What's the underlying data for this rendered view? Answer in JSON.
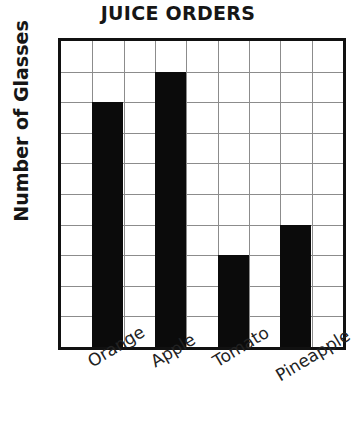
{
  "chart_data": {
    "type": "bar",
    "title": "JUICE ORDERS",
    "xlabel": "",
    "ylabel": "Number of Glasses",
    "categories": [
      "Orange",
      "Apple",
      "Tomato",
      "Pineapple"
    ],
    "values": [
      8,
      9,
      3,
      4
    ],
    "ylim": [
      0,
      10
    ],
    "y_ticks": [
      0,
      2,
      4,
      6,
      8,
      10
    ],
    "y_tick_labels": [
      "0",
      "2",
      "4",
      "6",
      "8",
      "10"
    ],
    "y_gridline_step": 1,
    "grid": true,
    "legend": false,
    "bar_color": "#0b0b0b",
    "grid_color": "#8c8c8c",
    "axis_color": "#111111",
    "x_tick_label_rotation": -31,
    "columns_total": 9,
    "bar_columns": [
      2,
      4,
      6,
      8
    ]
  },
  "axes": {
    "title": "JUICE ORDERS",
    "y_title": "Number of Glasses"
  }
}
